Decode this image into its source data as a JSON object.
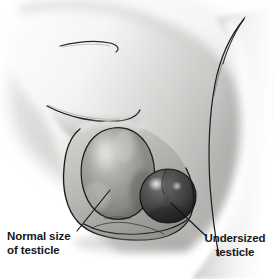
{
  "figure": {
    "style": "greyscale airbrush medical illustration",
    "background_color": "#ffffff",
    "outline_color": "#1a1a1a"
  },
  "labels": {
    "normal": {
      "line1": "Normal size",
      "line2": "of testicle",
      "align": "left"
    },
    "undersized": {
      "line1": "Undersized",
      "line2": "testicle",
      "align": "center"
    }
  },
  "anatomy": {
    "skin_light": "#f2f2f2",
    "skin_mid": "#c8c8c6",
    "skin_shadow": "#8e8e8c",
    "scrotum_fill": "#b2b2ae",
    "normal_testicle": {
      "name": "normal-size-testicle",
      "fill": "#9a9a95",
      "highlight": "#cfcfc9",
      "shadow": "#6b6b66",
      "shape": "large mottled ovoid"
    },
    "undersized_testicle": {
      "name": "undersized-testicle",
      "fill": "#4d4d4d",
      "highlight": "#8c8c8c",
      "shadow": "#2a2a2a",
      "shape": "small glossy sphere"
    }
  },
  "leaders": {
    "normal": {
      "from_x": 110,
      "from_y": 190,
      "to_x": 77,
      "to_y": 231
    },
    "undersized": {
      "from_x": 171,
      "from_y": 203,
      "to_x": 206,
      "to_y": 236
    }
  }
}
